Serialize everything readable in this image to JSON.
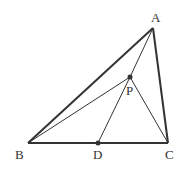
{
  "diagram": {
    "labels": {
      "A": "A",
      "B": "B",
      "C": "C",
      "D": "D",
      "P": "P"
    },
    "points": {
      "A": [
        153,
        28
      ],
      "B": [
        28,
        143
      ],
      "C": [
        168,
        143
      ],
      "D": [
        98,
        143
      ],
      "P": [
        130,
        77
      ]
    },
    "segments": [
      [
        "A",
        "B"
      ],
      [
        "B",
        "C"
      ],
      [
        "C",
        "A"
      ],
      [
        "A",
        "P"
      ],
      [
        "P",
        "D"
      ],
      [
        "B",
        "P"
      ],
      [
        "P",
        "C"
      ]
    ],
    "colors": {
      "stroke": "#333333",
      "background": "#ffffff"
    }
  }
}
